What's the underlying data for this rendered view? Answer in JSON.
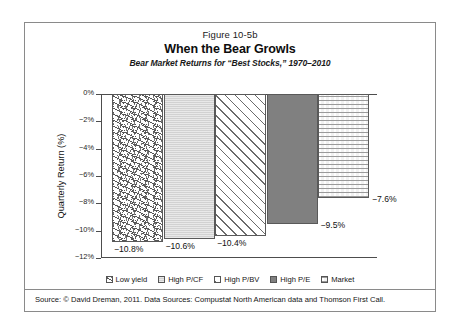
{
  "figure": {
    "number": "Figure 10-5b",
    "title": "When the Bear Growls",
    "subtitle": "Bear Market Returns for “Best Stocks,” 1970–2010",
    "source": "Source: © David Dreman, 2011. Data Sources: Compustat North American data and Thomson First Call."
  },
  "chart_data": {
    "type": "bar",
    "title": "When the Bear Growls",
    "subtitle": "Bear Market Returns for “Best Stocks,” 1970–2010",
    "xlabel": "",
    "ylabel": "Quarterly Return (%)",
    "ylim": [
      -12,
      0
    ],
    "ytick_labels": [
      "0%",
      "−2%",
      "−4%",
      "−6%",
      "−8%",
      "−10%",
      "−12%"
    ],
    "ytick_values": [
      0,
      -2,
      -4,
      -6,
      -8,
      -10,
      -12
    ],
    "grid": false,
    "legend_position": "bottom",
    "categories": [
      "Low yield",
      "High P/CF",
      "High P/BV",
      "High P/E",
      "Market"
    ],
    "values": [
      -10.8,
      -10.6,
      -10.4,
      -9.5,
      -7.6
    ],
    "value_labels": [
      "−10.8%",
      "−10.6%",
      "−10.4%",
      "−9.5%",
      "−7.6%"
    ],
    "series": [
      {
        "name": "Quarterly Return",
        "points": [
          {
            "category": "Low yield",
            "value": -10.8,
            "label": "−10.8%",
            "fill": "dashes",
            "fill_color": "#ffffff"
          },
          {
            "category": "High P/CF",
            "value": -10.6,
            "label": "−10.6%",
            "fill": "lightgray",
            "fill_color": "#d2d2d2"
          },
          {
            "category": "High P/BV",
            "value": -10.4,
            "label": "−10.4%",
            "fill": "diagonal",
            "fill_color": "#ffffff"
          },
          {
            "category": "High P/E",
            "value": -9.5,
            "label": "−9.5%",
            "fill": "darkgray",
            "fill_color": "#808080"
          },
          {
            "category": "Market",
            "value": -7.6,
            "label": "−7.6%",
            "fill": "stipple",
            "fill_color": "#f2f2f2"
          }
        ]
      }
    ]
  },
  "legend": {
    "items": [
      {
        "label": "Low yield",
        "fill": "dashes"
      },
      {
        "label": "High P/CF",
        "fill": "lightgray"
      },
      {
        "label": "High P/BV",
        "fill": "diagonal"
      },
      {
        "label": "High P/E",
        "fill": "darkgray"
      },
      {
        "label": "Market",
        "fill": "stipple"
      }
    ]
  }
}
